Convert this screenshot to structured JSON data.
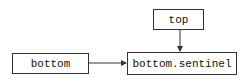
{
  "diagram": {
    "nodes": [
      {
        "id": "top",
        "label": "top"
      },
      {
        "id": "bottom",
        "label": "bottom"
      },
      {
        "id": "bottom_sentinel",
        "label": "bottom.sentinel"
      }
    ],
    "edges": [
      {
        "from": "top",
        "to": "bottom_sentinel"
      },
      {
        "from": "bottom",
        "to": "bottom_sentinel"
      }
    ],
    "colors": {
      "stroke": "#333333",
      "background": "#ffffff"
    }
  }
}
